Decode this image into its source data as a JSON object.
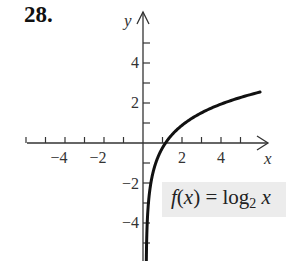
{
  "problem": {
    "number": "28."
  },
  "axes": {
    "x_label": "x",
    "y_label": "y",
    "x_tick_labels": [
      "−4",
      "−2",
      "2",
      "4"
    ],
    "y_tick_labels": [
      "4",
      "2",
      "−2",
      "−4"
    ]
  },
  "function_label": {
    "prefix_f": "f",
    "open": "(",
    "var": "x",
    "close": ")",
    "equals": " = log",
    "base": "2",
    "arg": "x"
  },
  "colors": {
    "curve": "#111111",
    "axes": "#333333",
    "label_box": "#ececec"
  },
  "chart_data": {
    "type": "line",
    "title": "28.",
    "function": "f(x) = log2 x",
    "xlabel": "x",
    "ylabel": "y",
    "xlim": [
      -6.5,
      6.5
    ],
    "ylim": [
      -6,
      6.5
    ],
    "x_ticks": [
      -6,
      -5,
      -4,
      -3,
      -2,
      -1,
      1,
      2,
      3,
      4,
      5
    ],
    "y_ticks": [
      -5,
      -4,
      -3,
      -2,
      -1,
      1,
      2,
      3,
      4,
      5
    ],
    "x_tick_labels": [
      "-4",
      "-2",
      "2",
      "4"
    ],
    "y_tick_labels": [
      "4",
      "2",
      "-2",
      "-4"
    ],
    "grid": false,
    "legend": "none",
    "series": [
      {
        "name": "f(x) = log2 x",
        "x": [
          0.015625,
          0.03125,
          0.0625,
          0.125,
          0.25,
          0.5,
          1,
          2,
          3,
          4,
          5,
          5.85
        ],
        "values": [
          -6,
          -5,
          -4,
          -3,
          -2,
          -1,
          0,
          1,
          1.585,
          2,
          2.322,
          2.55
        ]
      }
    ],
    "annotations": [
      "f(x) = log2 x"
    ]
  }
}
